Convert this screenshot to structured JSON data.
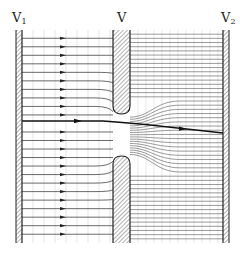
{
  "figure": {
    "labels": {
      "left_wall": {
        "main": "V",
        "sub": "1"
      },
      "middle_wall": {
        "main": "V",
        "sub": ""
      },
      "right_wall": {
        "main": "V",
        "sub": "2"
      }
    },
    "colors": {
      "line": "#333333",
      "grid": "#c8c8c8",
      "hatch": "#777777",
      "wall_outline": "#222222",
      "background": "#ffffff"
    },
    "geometry": {
      "left_wall_x": [
        16,
        22
      ],
      "middle_wall_x": [
        113,
        130
      ],
      "right_wall_x": [
        223,
        229
      ],
      "top_y": 30,
      "bottom_y": 243,
      "aperture_y": [
        113,
        157
      ],
      "central_streamline": {
        "start_y": 121,
        "end_y": 133,
        "arrow_x": [
          78,
          183
        ]
      }
    },
    "left_streamlines_count": 24,
    "right_streamlines_count": 50
  }
}
